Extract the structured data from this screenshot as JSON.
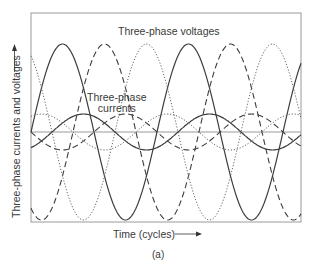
{
  "chart_data": {
    "type": "line",
    "title": "",
    "annotations": [
      {
        "text": "Three-phase voltages",
        "position": "top-center"
      },
      {
        "text": "Three-phase\ncurrents",
        "position": "center-left"
      }
    ],
    "xlabel": "Time (cycles)",
    "ylabel": "Three-phase currents and voltages",
    "caption": "(a)",
    "grid": false,
    "legend": null,
    "x_cycles_shown": 2.15,
    "series": [
      {
        "name": "Voltage phase A",
        "style": "solid",
        "amplitude": 1.0,
        "phase_deg": 0
      },
      {
        "name": "Voltage phase B",
        "style": "dashed",
        "amplitude": 1.0,
        "phase_deg": -120
      },
      {
        "name": "Voltage phase C",
        "style": "dotted",
        "amplitude": 1.0,
        "phase_deg": 120
      },
      {
        "name": "Current phase A",
        "style": "solid",
        "amplitude": 0.21,
        "phase_deg": -60
      },
      {
        "name": "Current phase B",
        "style": "dashed",
        "amplitude": 0.21,
        "phase_deg": -180
      },
      {
        "name": "Current phase C",
        "style": "dotted",
        "amplitude": 0.21,
        "phase_deg": 60
      }
    ]
  },
  "labels": {
    "voltages": "Three-phase voltages",
    "currents_line1": "Three-phase",
    "currents_line2": "currents",
    "xlabel": "Time (cycles)",
    "ylabel": "Three-phase currents and voltages",
    "caption": "(a)"
  },
  "plot": {
    "left": 31,
    "top": 13,
    "right": 301,
    "bottom": 222,
    "zero_y": 132,
    "period_px": 126,
    "voltage_amp_px": 88,
    "current_amp_px": 18,
    "origin_x": 31,
    "line_color": "#444444",
    "frame_color": "#999999"
  }
}
